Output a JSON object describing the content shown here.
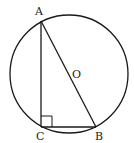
{
  "diagram": {
    "type": "geometry",
    "colors": {
      "stroke": "#1a1a1a",
      "background": "#ffffff",
      "text": "#222222"
    },
    "circle": {
      "center_label": "O",
      "cx": 69,
      "cy": 74,
      "r": 59
    },
    "points": {
      "A": {
        "label": "A",
        "x": 41,
        "y": 21
      },
      "B": {
        "label": "B",
        "x": 96,
        "y": 127
      },
      "C": {
        "label": "C",
        "x": 41,
        "y": 127
      },
      "O": {
        "label": "O",
        "x": 69,
        "y": 74
      }
    },
    "segments": [
      "AC",
      "CB",
      "AB"
    ],
    "right_angle_at": "C"
  }
}
